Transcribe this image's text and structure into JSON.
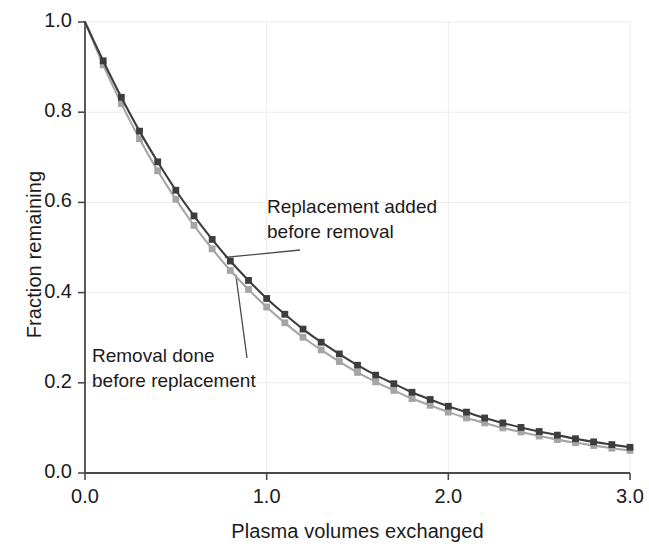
{
  "chart_data": {
    "type": "line",
    "title": "",
    "xlabel": "Plasma volumes exchanged",
    "ylabel": "Fraction remaining",
    "xlim": [
      0.0,
      3.0
    ],
    "ylim": [
      0.0,
      1.0
    ],
    "xticks": [
      "0.0",
      "1.0",
      "2.0",
      "3.0"
    ],
    "xtick_values": [
      0.0,
      1.0,
      2.0,
      3.0
    ],
    "yticks": [
      "0.0",
      "0.2",
      "0.4",
      "0.6",
      "0.8",
      "1.0"
    ],
    "ytick_values": [
      0.0,
      0.2,
      0.4,
      0.6,
      0.8,
      1.0
    ],
    "grid": true,
    "legend_position": "none",
    "marker": "square",
    "marker_interval": 0.1,
    "x": [
      0.0,
      0.1,
      0.2,
      0.3,
      0.4,
      0.5,
      0.6,
      0.7,
      0.8,
      0.9,
      1.0,
      1.1,
      1.2,
      1.3,
      1.4,
      1.5,
      1.6,
      1.7,
      1.8,
      1.9,
      2.0,
      2.1,
      2.2,
      2.3,
      2.4,
      2.5,
      2.6,
      2.7,
      2.8,
      2.9,
      3.0
    ],
    "series": [
      {
        "name": "Replacement added before removal",
        "color": "#3d3d3d",
        "values": [
          1.0,
          0.914,
          0.833,
          0.758,
          0.69,
          0.627,
          0.57,
          0.518,
          0.47,
          0.427,
          0.387,
          0.352,
          0.319,
          0.29,
          0.264,
          0.239,
          0.217,
          0.198,
          0.179,
          0.163,
          0.148,
          0.135,
          0.122,
          0.111,
          0.101,
          0.092,
          0.084,
          0.076,
          0.069,
          0.063,
          0.057
        ]
      },
      {
        "name": "Removal done before replacement",
        "color": "#a5a5a5",
        "values": [
          1.0,
          0.905,
          0.819,
          0.741,
          0.67,
          0.607,
          0.549,
          0.497,
          0.449,
          0.407,
          0.368,
          0.333,
          0.301,
          0.273,
          0.247,
          0.223,
          0.202,
          0.183,
          0.165,
          0.15,
          0.135,
          0.122,
          0.111,
          0.1,
          0.091,
          0.082,
          0.074,
          0.067,
          0.061,
          0.055,
          0.05
        ]
      }
    ],
    "annotations": [
      {
        "text_line1": "Replacement added",
        "text_line2": "before removal",
        "target_series": "Replacement added before removal",
        "target_x": 0.77,
        "target_y": 0.478
      },
      {
        "text_line1": "Removal done",
        "text_line2": "before replacement",
        "target_series": "Removal done before replacement",
        "target_x": 0.83,
        "target_y": 0.44
      }
    ]
  },
  "axes": {
    "line_color": "#4a4a4a",
    "grid_color": "#ececec"
  }
}
